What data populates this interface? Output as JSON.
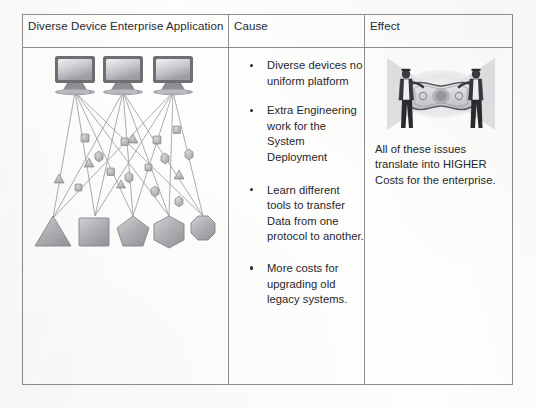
{
  "table": {
    "headers": [
      {
        "id": "application",
        "label": "Diverse Device Enterprise Application"
      },
      {
        "id": "cause",
        "label": "Cause"
      },
      {
        "id": "effect",
        "label": "Effect"
      }
    ],
    "cause_bullets": [
      "Diverse devices no uniform platform",
      "Extra Engineering work for the System Deployment",
      "Learn different tools to transfer Data from one protocol to another.",
      "More costs for upgrading old legacy systems."
    ],
    "effect_caption": "All of these issues translate into HIGHER Costs for the enterprise."
  },
  "diagram": {
    "name": "diverse-device-network-diagram",
    "computers": [
      {
        "id": "computer-1",
        "x": 30
      },
      {
        "id": "computer-2",
        "x": 78
      },
      {
        "id": "computer-3",
        "x": 128
      }
    ],
    "device_shapes": [
      {
        "id": "device-triangle",
        "shape": "triangle"
      },
      {
        "id": "device-square",
        "shape": "square"
      },
      {
        "id": "device-pentagon",
        "shape": "pentagon"
      },
      {
        "id": "device-hexagon",
        "shape": "hexagon"
      },
      {
        "id": "device-octagon",
        "shape": "octagon"
      }
    ]
  },
  "effect_image": {
    "name": "stretched-dollar-bill-illustration",
    "description": "Two businessmen stretching a dollar bill"
  },
  "colors": {
    "border": "#8d8d92",
    "text": "#26262a",
    "paper": "#fdfdfc",
    "diagram_ink": "#8c8c92",
    "shape_fill": "#b9b9bd"
  }
}
